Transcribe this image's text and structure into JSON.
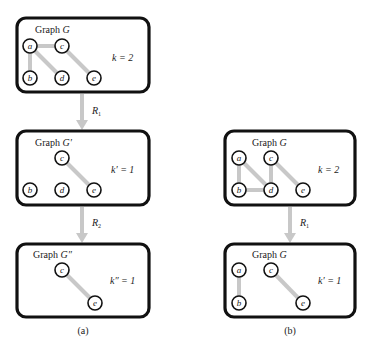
{
  "figure": {
    "panel_a": {
      "caption": "(a)",
      "graphs": [
        {
          "title_prefix": "Graph ",
          "title_name": "G",
          "k_label": "k = 2",
          "nodes": [
            "a",
            "b",
            "c",
            "d",
            "e"
          ],
          "edges": [
            [
              "a",
              "c"
            ],
            [
              "a",
              "b"
            ],
            [
              "a",
              "d"
            ],
            [
              "c",
              "e"
            ]
          ]
        },
        {
          "title_prefix": "Graph ",
          "title_name": "G′",
          "k_label": "k′ = 1",
          "nodes": [
            "c",
            "b",
            "d",
            "e"
          ],
          "edges": [
            [
              "c",
              "e"
            ]
          ]
        },
        {
          "title_prefix": "Graph ",
          "title_name": "G″",
          "k_label": "k″ = 1",
          "nodes": [
            "c",
            "e"
          ],
          "edges": [
            [
              "c",
              "e"
            ]
          ]
        }
      ],
      "arrows": [
        {
          "label": "R",
          "sub": "1"
        },
        {
          "label": "R",
          "sub": "2"
        }
      ]
    },
    "panel_b": {
      "caption": "(b)",
      "graphs": [
        {
          "title_prefix": "Graph ",
          "title_name": "G",
          "k_label": "k = 2",
          "nodes": [
            "a",
            "c",
            "b",
            "d",
            "e"
          ],
          "edges": [
            [
              "a",
              "b"
            ],
            [
              "a",
              "d"
            ],
            [
              "b",
              "d"
            ],
            [
              "c",
              "d"
            ],
            [
              "c",
              "e"
            ]
          ]
        },
        {
          "title_prefix": "Graph ",
          "title_name": "G",
          "k_label": "k′ = 1",
          "nodes": [
            "a",
            "c",
            "b",
            "e"
          ],
          "edges": [
            [
              "a",
              "b"
            ],
            [
              "c",
              "e"
            ]
          ]
        }
      ],
      "arrows": [
        {
          "label": "R",
          "sub": "1"
        }
      ]
    },
    "colors": {
      "box_stroke": "#111111",
      "edge": "#c8c8c8",
      "arrow": "#c8c8c8"
    }
  }
}
